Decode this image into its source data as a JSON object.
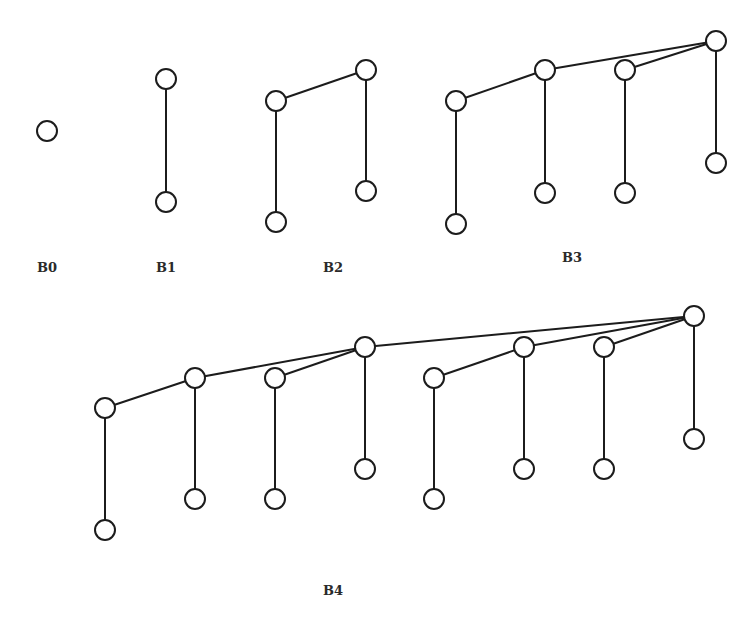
{
  "style": {
    "stroke_color": "#1c1c1c",
    "node_fill": "#ffffff",
    "node_radius": 10,
    "label_color": "#2a2a2a",
    "background": "#ffffff"
  },
  "trees": [
    {
      "id": "B0",
      "label": "B0",
      "label_pos": [
        47,
        267
      ],
      "nodes": [
        [
          47,
          131
        ]
      ],
      "edges": []
    },
    {
      "id": "B1",
      "label": "B1",
      "label_pos": [
        166,
        267
      ],
      "nodes": [
        [
          166,
          79
        ],
        [
          166,
          202
        ]
      ],
      "edges": [
        [
          [
            166,
            79
          ],
          [
            166,
            202
          ]
        ]
      ]
    },
    {
      "id": "B2",
      "label": "B2",
      "label_pos": [
        333,
        267
      ],
      "nodes": [
        [
          276,
          101
        ],
        [
          276,
          222
        ],
        [
          366,
          70
        ],
        [
          366,
          191
        ]
      ],
      "edges": [
        [
          [
            276,
            101
          ],
          [
            276,
            222
          ]
        ],
        [
          [
            276,
            101
          ],
          [
            366,
            70
          ]
        ],
        [
          [
            366,
            70
          ],
          [
            366,
            191
          ]
        ]
      ]
    },
    {
      "id": "B3",
      "label": "B3",
      "label_pos": [
        572,
        257
      ],
      "nodes": [
        [
          456,
          101
        ],
        [
          456,
          224
        ],
        [
          545,
          70
        ],
        [
          545,
          193
        ],
        [
          625,
          70
        ],
        [
          625,
          193
        ],
        [
          716,
          41
        ],
        [
          716,
          163
        ]
      ],
      "edges": [
        [
          [
            456,
            101
          ],
          [
            456,
            224
          ]
        ],
        [
          [
            456,
            101
          ],
          [
            545,
            70
          ]
        ],
        [
          [
            545,
            70
          ],
          [
            545,
            193
          ]
        ],
        [
          [
            545,
            70
          ],
          [
            716,
            41
          ]
        ],
        [
          [
            625,
            70
          ],
          [
            625,
            193
          ]
        ],
        [
          [
            625,
            70
          ],
          [
            716,
            41
          ]
        ],
        [
          [
            716,
            41
          ],
          [
            716,
            163
          ]
        ]
      ]
    },
    {
      "id": "B4",
      "label": "B4",
      "label_pos": [
        333,
        590
      ],
      "nodes": [
        [
          105,
          408
        ],
        [
          105,
          530
        ],
        [
          195,
          378
        ],
        [
          195,
          499
        ],
        [
          275,
          378
        ],
        [
          275,
          499
        ],
        [
          365,
          347
        ],
        [
          365,
          469
        ],
        [
          434,
          378
        ],
        [
          434,
          499
        ],
        [
          524,
          347
        ],
        [
          524,
          469
        ],
        [
          604,
          347
        ],
        [
          604,
          469
        ],
        [
          694,
          316
        ],
        [
          694,
          439
        ]
      ],
      "edges": [
        [
          [
            105,
            408
          ],
          [
            105,
            530
          ]
        ],
        [
          [
            105,
            408
          ],
          [
            195,
            378
          ]
        ],
        [
          [
            195,
            378
          ],
          [
            195,
            499
          ]
        ],
        [
          [
            195,
            378
          ],
          [
            365,
            347
          ]
        ],
        [
          [
            275,
            378
          ],
          [
            275,
            499
          ]
        ],
        [
          [
            275,
            378
          ],
          [
            365,
            347
          ]
        ],
        [
          [
            365,
            347
          ],
          [
            365,
            469
          ]
        ],
        [
          [
            365,
            347
          ],
          [
            694,
            316
          ]
        ],
        [
          [
            434,
            378
          ],
          [
            434,
            499
          ]
        ],
        [
          [
            434,
            378
          ],
          [
            524,
            347
          ]
        ],
        [
          [
            524,
            347
          ],
          [
            524,
            469
          ]
        ],
        [
          [
            524,
            347
          ],
          [
            694,
            316
          ]
        ],
        [
          [
            604,
            347
          ],
          [
            604,
            469
          ]
        ],
        [
          [
            604,
            347
          ],
          [
            694,
            316
          ]
        ],
        [
          [
            694,
            316
          ],
          [
            694,
            439
          ]
        ]
      ]
    }
  ]
}
